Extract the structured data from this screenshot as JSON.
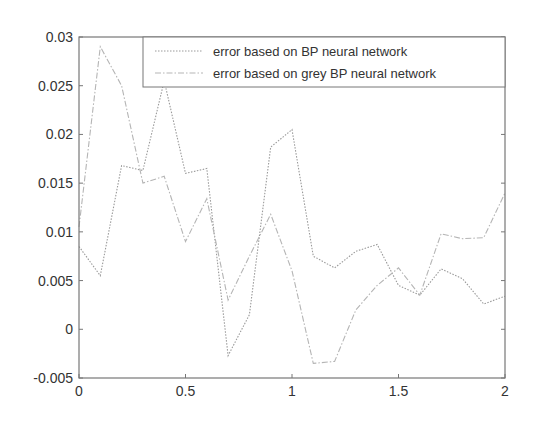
{
  "chart_data": {
    "type": "line",
    "title": "",
    "xlabel": "",
    "ylabel": "",
    "xlim": [
      0,
      2
    ],
    "ylim": [
      -0.005,
      0.03
    ],
    "grid": false,
    "legend_position": "top-right",
    "x": [
      0,
      0.1,
      0.2,
      0.3,
      0.4,
      0.5,
      0.6,
      0.7,
      0.8,
      0.9,
      1.0,
      1.1,
      1.2,
      1.3,
      1.4,
      1.5,
      1.6,
      1.7,
      1.8,
      1.9,
      2.0
    ],
    "x_ticks": [
      "0",
      "0.5",
      "1",
      "1.5",
      "2"
    ],
    "y_ticks": [
      "0.03",
      "0.025",
      "0.02",
      "0.015",
      "0.01",
      "0.005",
      "0",
      "-0.005"
    ],
    "series": [
      {
        "name": "error based on BP neural network",
        "style": "dotted",
        "color": "#9a9a9a",
        "values": [
          0.0085,
          0.0055,
          0.0168,
          0.0163,
          0.0255,
          0.016,
          0.0165,
          -0.0027,
          0.0015,
          0.0187,
          0.0205,
          0.0075,
          0.0063,
          0.008,
          0.0087,
          0.0045,
          0.0035,
          0.0062,
          0.0052,
          0.0026,
          0.0034
        ]
      },
      {
        "name": "error based on grey BP neural network",
        "style": "dash-dot",
        "color": "#b5b5b5",
        "values": [
          0.0105,
          0.029,
          0.025,
          0.015,
          0.0157,
          0.009,
          0.0134,
          0.003,
          0.0075,
          0.0118,
          0.006,
          -0.0035,
          -0.0033,
          0.002,
          0.0045,
          0.0063,
          0.0035,
          0.0098,
          0.0093,
          0.0094,
          0.014
        ]
      }
    ]
  }
}
